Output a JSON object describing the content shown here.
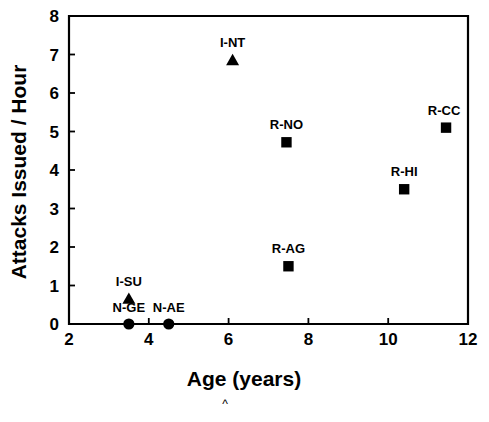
{
  "chart_data": {
    "type": "scatter",
    "title": "",
    "xlabel": "Age (years)",
    "ylabel": "Attacks Issued / Hour",
    "xlim": [
      2,
      12
    ],
    "ylim": [
      0,
      8
    ],
    "xticks": [
      "2",
      "4",
      "6",
      "8",
      "10",
      "12"
    ],
    "yticks": [
      "0",
      "1",
      "2",
      "3",
      "4",
      "5",
      "6",
      "7",
      "8"
    ],
    "grid": false,
    "legend": "none",
    "annotation_caret": "^",
    "points": [
      {
        "label": "I-NT",
        "x": 6.1,
        "y": 6.85,
        "marker": "triangle",
        "label_dx": 0,
        "label_dy": -13
      },
      {
        "label": "R-CC",
        "x": 11.45,
        "y": 5.1,
        "marker": "square",
        "label_dx": -2,
        "label_dy": -13
      },
      {
        "label": "R-NO",
        "x": 7.45,
        "y": 4.72,
        "marker": "square",
        "label_dx": 0,
        "label_dy": -13
      },
      {
        "label": "R-HI",
        "x": 10.4,
        "y": 3.5,
        "marker": "square",
        "label_dx": 0,
        "label_dy": -13
      },
      {
        "label": "R-AG",
        "x": 7.5,
        "y": 1.5,
        "marker": "square",
        "label_dx": 0,
        "label_dy": -13
      },
      {
        "label": "I-SU",
        "x": 3.5,
        "y": 0.65,
        "marker": "triangle",
        "label_dx": 0,
        "label_dy": -13
      },
      {
        "label": "N-GE",
        "x": 3.5,
        "y": 0.0,
        "marker": "circle",
        "label_dx": 0,
        "label_dy": -12
      },
      {
        "label": "N-AE",
        "x": 4.5,
        "y": 0.0,
        "marker": "circle",
        "label_dx": 0,
        "label_dy": -12
      }
    ]
  },
  "colors": {
    "marker": "#000000",
    "axis": "#000000",
    "background": "#ffffff"
  }
}
